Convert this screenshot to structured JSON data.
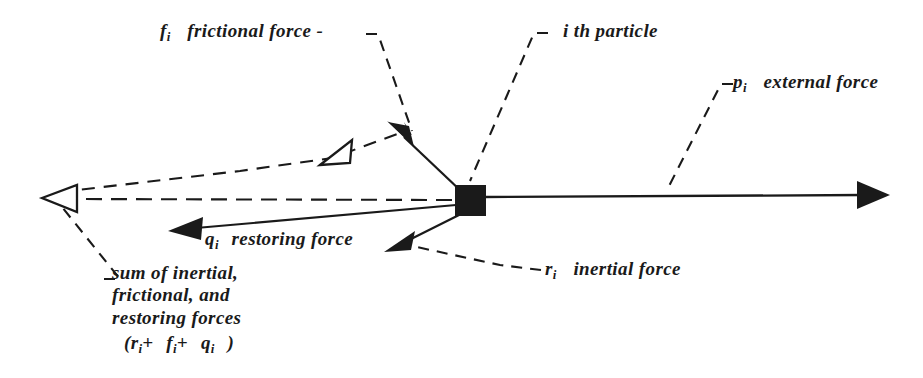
{
  "figure": {
    "background_color": "#ffffff",
    "ink_color": "#1a1a1a",
    "width": 923,
    "height": 378
  },
  "labels": {
    "frictional": {
      "symbol": "f",
      "subscript": "i",
      "text": "frictional force -"
    },
    "particle": {
      "leader": "—",
      "text": "i th particle"
    },
    "external": {
      "symbol": "p",
      "subscript": "i",
      "text": "external force"
    },
    "restoring": {
      "symbol": "q",
      "subscript": "i",
      "text": "restoring force"
    },
    "inertial": {
      "symbol": "r",
      "subscript": "i",
      "text": "inertial force"
    },
    "sum": {
      "line1": "sum of inertial,",
      "line2": "frictional, and",
      "line3": "restoring forces",
      "formula_open": "(",
      "formula_r": "r",
      "formula_r_sub": "i",
      "formula_plus1": "+",
      "formula_f": "f",
      "formula_f_sub": "i",
      "formula_plus2": "+",
      "formula_q": "q",
      "formula_q_sub": "i",
      "formula_close": ")"
    }
  },
  "diagram": {
    "particle_node": {
      "x": 455,
      "y": 185,
      "width": 31,
      "height": 31,
      "fill": "#1a1a1a"
    },
    "vectors": [
      {
        "name": "external-force",
        "symbol": "p_i",
        "from": [
          486,
          199
        ],
        "to": [
          889,
          196
        ],
        "style": "solid",
        "arrowhead": "filled",
        "direction": "right"
      },
      {
        "name": "frictional-force",
        "symbol": "f_i",
        "from": [
          461,
          200
        ],
        "to": [
          392,
          126
        ],
        "style": "solid",
        "arrowhead": "filled",
        "direction": "up-left"
      },
      {
        "name": "inertial-force",
        "symbol": "r_i",
        "from": [
          461,
          208
        ],
        "to": [
          389,
          249
        ],
        "style": "solid",
        "arrowhead": "filled",
        "direction": "down-left"
      },
      {
        "name": "restoring-force",
        "symbol": "q_i",
        "from": [
          458,
          202
        ],
        "to": [
          171,
          229
        ],
        "style": "solid",
        "arrowhead": "filled",
        "direction": "left"
      },
      {
        "name": "resultant-force",
        "symbol": "r_i + f_i + q_i",
        "from": [
          455,
          200
        ],
        "to": [
          44,
          198
        ],
        "style": "dashed",
        "arrowhead": "hollow",
        "direction": "left"
      }
    ],
    "leader_lines": [
      {
        "name": "leader-frictional",
        "points": "366,34 378,34 412,129"
      },
      {
        "name": "leader-particle",
        "points": "546,33 534,33 470,180"
      },
      {
        "name": "leader-external",
        "points": "731,84 721,84 668,188"
      },
      {
        "name": "leader-inertial",
        "points": "540,270 505,266 414,245"
      },
      {
        "name": "leader-sum",
        "points": "106,278 118,278 60,206"
      },
      {
        "name": "leader-resultant-upper",
        "points": "62,193 330,158 398,133"
      }
    ]
  }
}
